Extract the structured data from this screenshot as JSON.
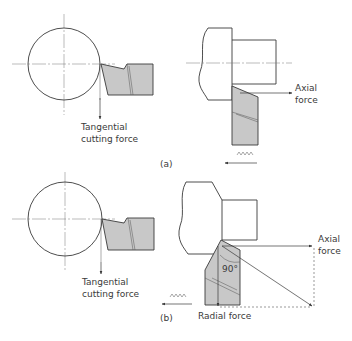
{
  "figure": {
    "panels": [
      {
        "id": "a",
        "caption": "(a)",
        "left_view": {
          "force_label_line1": "Tangential",
          "force_label_line2": "cutting force"
        },
        "right_view": {
          "force_label_line1": "Axial",
          "force_label_line2": "force",
          "feed_symbol": "∧∧∧∧"
        }
      },
      {
        "id": "b",
        "caption": "(b)",
        "left_view": {
          "force_label_line1": "Tangential",
          "force_label_line2": "cutting force"
        },
        "right_view": {
          "axial_label_line1": "Axial",
          "axial_label_line2": "force",
          "radial_label": "Radial force",
          "angle_label": "90°",
          "feed_symbol": "∧∧∧∧"
        }
      }
    ],
    "colors": {
      "tool_fill": "#c8c8c8",
      "line": "#3a3a3a"
    }
  }
}
